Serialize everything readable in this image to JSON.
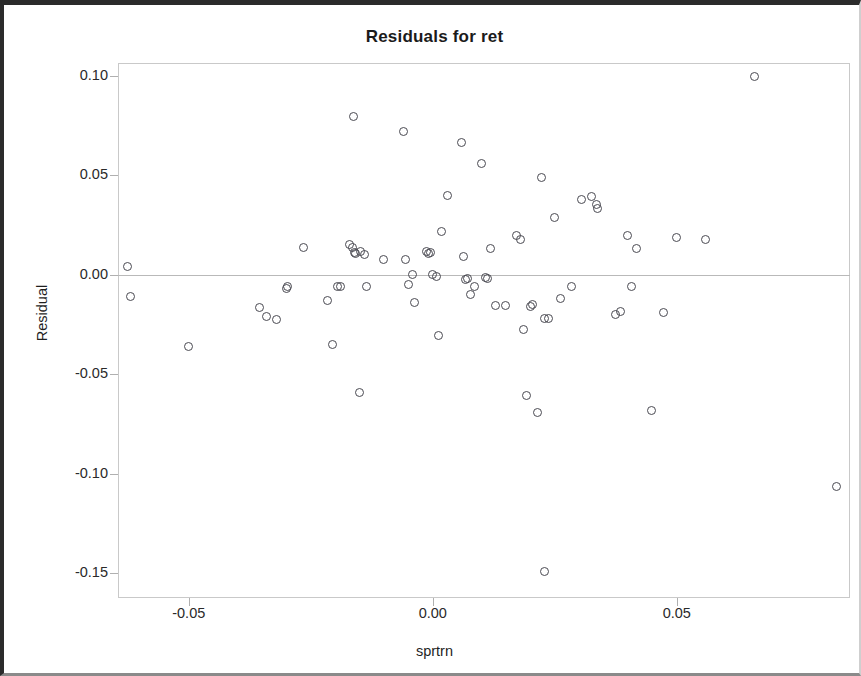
{
  "window": {
    "title": "Residuals for ret"
  },
  "chart_data": {
    "type": "scatter",
    "title": "Residuals for ret",
    "xlabel": "sprtrn",
    "ylabel": "Residual",
    "xlim": [
      -0.0645,
      0.0855
    ],
    "ylim": [
      -0.1625,
      0.1065
    ],
    "grid": false,
    "legend": null,
    "reference_line": {
      "orientation": "horizontal",
      "y": 0.0,
      "style": "dotted",
      "color": "#b9b9b9"
    },
    "marker": {
      "shape": "open-circle",
      "size_px": 9,
      "edge_color": "#4a4a52",
      "fill": "none"
    },
    "xticks": [
      -0.05,
      0.0,
      0.05
    ],
    "xtick_labels": [
      "-0.05",
      "0.00",
      "0.05"
    ],
    "yticks": [
      0.1,
      0.05,
      0.0,
      -0.05,
      -0.1,
      -0.15
    ],
    "ytick_labels": [
      "0.10",
      "0.05",
      "0.00",
      "-0.05",
      "-0.10",
      "-0.15"
    ],
    "n_points": 69,
    "x": [
      -0.0625,
      -0.062,
      -0.05,
      -0.0355,
      -0.034,
      -0.032,
      -0.03,
      -0.0298,
      -0.0265,
      -0.0215,
      -0.0205,
      -0.0195,
      -0.019,
      -0.017,
      -0.0165,
      -0.0163,
      -0.016,
      -0.0158,
      -0.015,
      -0.0148,
      -0.014,
      -0.0135,
      -0.01,
      -0.006,
      -0.0055,
      -0.005,
      -0.0042,
      -0.0038,
      -0.0012,
      -0.0008,
      -0.0005,
      0.0,
      0.0008,
      0.0012,
      0.0018,
      0.003,
      0.0058,
      0.0062,
      0.0068,
      0.0072,
      0.0078,
      0.0085,
      0.01,
      0.0108,
      0.0112,
      0.0118,
      0.0128,
      0.015,
      0.0172,
      0.018,
      0.0185,
      0.0192,
      0.02,
      0.0205,
      0.0215,
      0.0222,
      0.0228,
      0.0238,
      0.025,
      0.0262,
      0.0285,
      0.0305,
      0.0325,
      0.0335,
      0.0338,
      0.0375,
      0.0385,
      0.04,
      0.0408,
      0.0418,
      0.0448,
      0.0472,
      0.05,
      0.0558,
      0.066,
      0.0828
    ],
    "y": [
      0.0042,
      -0.0108,
      -0.036,
      -0.0163,
      -0.0208,
      -0.0225,
      -0.0068,
      -0.006,
      0.0135,
      -0.0128,
      -0.035,
      -0.0058,
      -0.006,
      0.015,
      0.0138,
      0.0795,
      0.0112,
      0.0108,
      -0.059,
      0.0118,
      0.01,
      -0.006,
      0.0075,
      0.072,
      0.0078,
      -0.0048,
      0.0002,
      -0.0138,
      0.0118,
      0.0108,
      0.0112,
      0.0,
      -0.001,
      -0.0305,
      0.022,
      0.04,
      0.0665,
      0.009,
      -0.0022,
      -0.002,
      -0.0098,
      -0.006,
      0.0558,
      -0.0015,
      -0.0018,
      0.0132,
      -0.0155,
      -0.0152,
      0.02,
      0.0178,
      -0.0275,
      -0.0605,
      -0.016,
      -0.0148,
      -0.069,
      0.049,
      -0.0222,
      -0.0218,
      0.029,
      -0.0118,
      -0.006,
      0.0378,
      0.0392,
      0.0355,
      0.0332,
      -0.0198,
      -0.0182,
      0.0198,
      -0.006,
      0.0132,
      -0.068,
      -0.0192,
      0.019,
      0.018,
      0.0995,
      -0.1065
    ],
    "outliers": [
      {
        "x": 0.0228,
        "y": -0.149,
        "note": "largest negative residual"
      },
      {
        "x": 0.0828,
        "y": -0.1065,
        "note": "rightmost, large negative residual"
      },
      {
        "x": 0.066,
        "y": 0.0995,
        "note": "largest positive residual"
      }
    ]
  }
}
